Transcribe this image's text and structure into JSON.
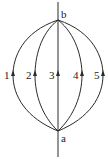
{
  "diagram": {
    "type": "field-lines",
    "nodes": [
      {
        "id": "b",
        "label": "b",
        "x": 58,
        "y": 20,
        "label_x": 61,
        "label_y": 18
      },
      {
        "id": "a",
        "label": "a",
        "x": 58,
        "y": 131,
        "label_x": 61,
        "label_y": 142
      }
    ],
    "paths": [
      {
        "id": "1",
        "label": "1",
        "apex_x": 13,
        "label_x": 5,
        "direction": "a-to-b"
      },
      {
        "id": "2",
        "label": "2",
        "apex_x": 35,
        "label_x": 27,
        "direction": "a-to-b"
      },
      {
        "id": "3",
        "label": "3",
        "apex_x": 58,
        "label_x": 50,
        "direction": "a-to-b"
      },
      {
        "id": "4",
        "label": "4",
        "apex_x": 82,
        "label_x": 74,
        "direction": "a-to-b"
      },
      {
        "id": "5",
        "label": "5",
        "apex_x": 103,
        "label_x": 95,
        "direction": "a-to-b"
      }
    ],
    "axis_line": {
      "x": 58,
      "y_top": 2,
      "y_bottom": 157
    },
    "label_y": 79,
    "arrow_y": 73,
    "stroke_color": "#2a2a2a"
  }
}
